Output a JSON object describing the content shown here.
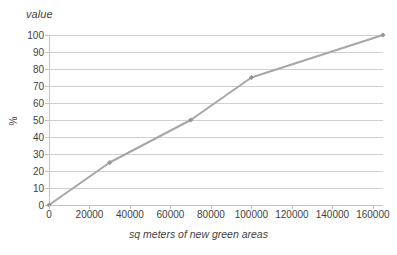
{
  "chart_data": {
    "type": "line",
    "title": "value",
    "xlabel": "sq meters of new green areas",
    "ylabel": "%",
    "x": [
      0,
      30000,
      70000,
      100000,
      165000
    ],
    "values": [
      0,
      25,
      50,
      75,
      100
    ],
    "series": [
      {
        "name": "value",
        "x": [
          0,
          30000,
          70000,
          100000,
          165000
        ],
        "values": [
          0,
          25,
          50,
          75,
          100
        ]
      }
    ],
    "xlim": [
      0,
      165000
    ],
    "ylim": [
      0,
      100
    ],
    "x_ticks": [
      0,
      20000,
      40000,
      60000,
      80000,
      100000,
      120000,
      140000,
      160000
    ],
    "x_tick_labels": [
      "0",
      "20000",
      "40000",
      "60000",
      "80000",
      "100000",
      "120000",
      "140000",
      "160000"
    ],
    "y_ticks": [
      0,
      10,
      20,
      30,
      40,
      50,
      60,
      70,
      80,
      90,
      100
    ],
    "y_tick_labels": [
      "0",
      "10",
      "20",
      "30",
      "40",
      "50",
      "60",
      "70",
      "80",
      "90",
      "100"
    ],
    "grid": "horizontal",
    "legend": "none",
    "line_color": "#a6a6a6",
    "marker_color": "#949494",
    "gridline_color": "#d0d0d0",
    "axis_color": "#c4c4c4",
    "text_color": "#3f3f3f",
    "background_color": "#ffffff",
    "marker": "diamond"
  }
}
